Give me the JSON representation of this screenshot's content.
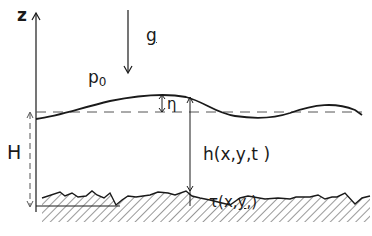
{
  "diagram": {
    "labels": {
      "z_axis": "z",
      "gravity": "g",
      "pressure_base": "p",
      "pressure_sub": "0",
      "surface_elevation": "η",
      "mean_depth": "H",
      "local_depth": "h(x,y,t )",
      "bottom_prefix": "τ(x,",
      "bottom_y": "y",
      "bottom_suffix": ",)"
    },
    "colors": {
      "line": "#1a1a1a",
      "dashed": "#555555",
      "hatch": "#333333",
      "background": "#ffffff"
    }
  }
}
